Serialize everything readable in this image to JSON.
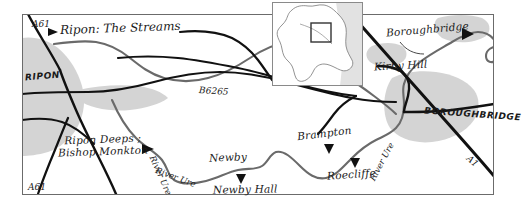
{
  "map": {
    "title": "Ripon to Boroughbridge area map",
    "region": "North Yorkshire, England",
    "style": "hand-drawn sketch map",
    "colors": {
      "background": "#ffffff",
      "border": "#555555",
      "road": "#111111",
      "river": "#555555",
      "urban_fill": "#d2d2d2",
      "text": "#1a1a1a",
      "inset_outline": "#666666"
    },
    "frame": {
      "x": 22,
      "y": 14,
      "width": 472,
      "height": 181
    },
    "inset": {
      "name": "location-inset",
      "x": 272,
      "y": 2,
      "width": 91,
      "height": 84,
      "description": "outline of England with locator box",
      "locator_box": {
        "x": 311,
        "y": 23,
        "width": 20,
        "height": 19
      }
    },
    "labels": {
      "site_title": "Ripon: The Streams",
      "ripon_town": "RIPON",
      "boroughbridge_town": "BOROUGHBRIDGE",
      "kirby_hill": "Kirby Hill",
      "boroughbridge_point": "Boroughbridge",
      "ripon_deeps_line1": "Ripon Deeps ;",
      "ripon_deeps_line2": "Bishop Monkton",
      "newby": "Newby",
      "newby_hall": "Newby Hall",
      "brampton": "Brampton",
      "roecliffe": "Roecliffe",
      "road_a61_north": "A61",
      "road_a61_south": "A61",
      "road_b6265": "B6265",
      "road_a1": "A1",
      "river_ure_west": "River Ure",
      "river_ure_centre": "River Ure",
      "river_ure_east": "River Ure"
    },
    "markers": [
      {
        "name": "ripon-the-streams",
        "type": "triangle-right",
        "x": 50,
        "y": 32
      },
      {
        "name": "ripon-deeps-bishop-monkton",
        "type": "triangle-right",
        "x": 148,
        "y": 148
      },
      {
        "name": "newby-hall",
        "type": "triangle-up",
        "x": 241,
        "y": 181
      },
      {
        "name": "brampton",
        "type": "triangle-down",
        "x": 329,
        "y": 150
      },
      {
        "name": "roecliffe",
        "type": "triangle-down",
        "x": 355,
        "y": 165
      },
      {
        "name": "boroughbridge",
        "type": "triangle-right",
        "x": 470,
        "y": 33
      }
    ],
    "features": {
      "roads": [
        "A61",
        "B6265",
        "A1",
        "minor roads"
      ],
      "rivers": [
        "River Ure"
      ],
      "settlements": [
        "Ripon",
        "Boroughbridge",
        "Kirby Hill",
        "Bishop Monkton",
        "Newby",
        "Newby Hall",
        "Brampton",
        "Roecliffe"
      ]
    }
  }
}
